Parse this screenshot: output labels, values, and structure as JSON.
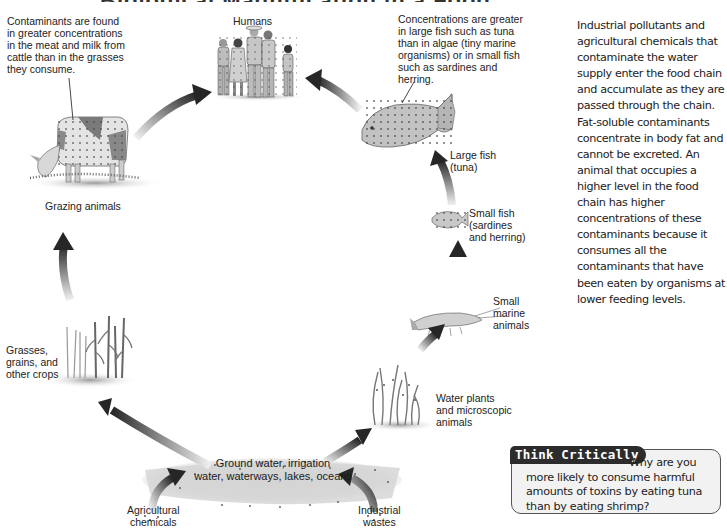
{
  "diagram": {
    "title_partial": "Biological Magnification in a Food Chain",
    "nodes": {
      "humans": {
        "label": "Humans"
      },
      "grazing_animals": {
        "label": "Grazing animals"
      },
      "grasses": {
        "label": "Grasses,\ngrains, and\nother crops"
      },
      "water": {
        "label": "Ground water, irrigation\nwater, waterways, lakes, oceans"
      },
      "agricultural_chemicals": {
        "label": "Agricultural\nchemicals"
      },
      "industrial_wastes": {
        "label": "Industrial\nwastes"
      },
      "water_plants": {
        "label": "Water plants\nand microscopic\nanimals"
      },
      "small_marine": {
        "label": "Small\nmarine\nanimals"
      },
      "small_fish": {
        "label": "Small fish\n(sardines\nand herring)"
      },
      "large_fish": {
        "label": "Large fish\n(tuna)"
      }
    },
    "callouts": {
      "cattle": "Contaminants are found\nin greater concentrations\nin the meat and milk from\ncattle than in the grasses\nthey consume.",
      "fish": "Concentrations are greater\nin large fish such as tuna\nthan in algae (tiny marine\norganisms) or in small fish\nsuch as sardines and\nherring."
    },
    "flow": [
      "Agricultural chemicals -> Water",
      "Industrial wastes -> Water",
      "Water -> Grasses, grains, and other crops",
      "Grasses -> Grazing animals",
      "Grazing animals -> Humans",
      "Water -> Water plants and microscopic animals",
      "Water plants -> Small marine animals",
      "Small marine animals -> Small fish",
      "Small fish -> Large fish",
      "Large fish -> Humans"
    ]
  },
  "sidebar": {
    "paragraph": "Industrial pollutants and agricultural chemicals that contaminate the water supply enter the food chain and accumulate as they are passed through the chain. Fat-soluble contaminants concentrate in body fat and cannot be excreted. An animal that occupies a higher level in the food chain has higher concentrations of these contaminants because it consumes all the contaminants that have been eaten by organisms at lower feeding levels."
  },
  "think_critically": {
    "tag": "Think Critically",
    "question": "Why are you more likely to consume harmful amounts of toxins by eating tuna than by eating shrimp?"
  },
  "colors": {
    "arrow_dark": "#2a2a2a",
    "arrow_light": "#e0e0e0",
    "water_band": "#d4d4d4",
    "tag_bg": "#2c2c2c",
    "box_bg": "#f2f2f2"
  }
}
